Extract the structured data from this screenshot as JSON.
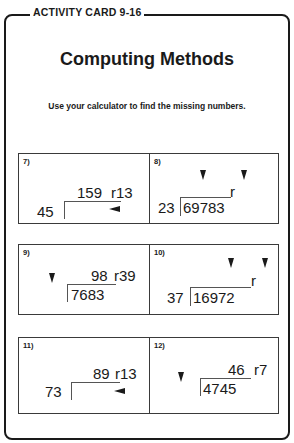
{
  "card": {
    "label": "ACTIVITY CARD 9-16",
    "title": "Computing Methods",
    "instructions": "Use your calculator to find the missing numbers."
  },
  "problems": [
    {
      "number": "7)",
      "divisor": "45",
      "dividend": "",
      "quotient": "159",
      "remainder": "r13",
      "missing": [
        "dividend"
      ]
    },
    {
      "number": "8)",
      "divisor": "23",
      "dividend": "69783",
      "quotient": "",
      "remainder": "r",
      "missing": [
        "quotient",
        "remainder"
      ]
    },
    {
      "number": "9)",
      "divisor": "",
      "dividend": "7683",
      "quotient": "98",
      "remainder": "r39",
      "missing": [
        "divisor"
      ]
    },
    {
      "number": "10)",
      "divisor": "37",
      "dividend": "16972",
      "quotient": "",
      "remainder": "r",
      "missing": [
        "quotient",
        "remainder"
      ]
    },
    {
      "number": "11)",
      "divisor": "73",
      "dividend": "",
      "quotient": "89",
      "remainder": "r13",
      "missing": [
        "dividend"
      ]
    },
    {
      "number": "12)",
      "divisor": "",
      "dividend": "4745",
      "quotient": "46",
      "remainder": "r7",
      "missing": [
        "divisor"
      ]
    }
  ]
}
